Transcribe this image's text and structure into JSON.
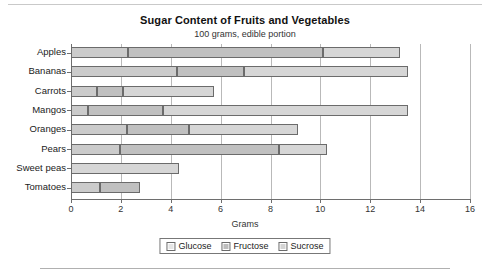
{
  "chart_data": {
    "type": "bar",
    "orientation": "horizontal",
    "stacked": true,
    "title": "Sugar Content of Fruits and Vegetables",
    "subtitle": "100 grams, edible portion",
    "xlabel": "Grams",
    "ylabel": "",
    "xlim": [
      0,
      16
    ],
    "xticks": [
      0,
      2,
      4,
      6,
      8,
      10,
      12,
      14,
      16
    ],
    "xtick_labels": [
      "0",
      "2",
      "4",
      "6",
      "8",
      "10",
      "12",
      "14",
      "16"
    ],
    "grid": "vertical",
    "legend_position": "bottom-center",
    "categories": [
      "Apples",
      "Bananas",
      "Carrots",
      "Mangos",
      "Oranges",
      "Pears",
      "Sweet peas",
      "Tomatoes"
    ],
    "series": [
      {
        "name": "Glucose",
        "color": "#cbcbcb",
        "values": [
          2.3,
          4.25,
          1.05,
          0.7,
          2.25,
          1.95,
          0.0,
          1.15
        ]
      },
      {
        "name": "Fructose",
        "color": "#c0c0c0",
        "values": [
          7.8,
          2.7,
          1.05,
          3.0,
          2.5,
          6.4,
          0.0,
          1.6
        ]
      },
      {
        "name": "Sucrose",
        "color": "#d6d6d6",
        "values": [
          3.1,
          6.55,
          3.65,
          9.8,
          4.35,
          1.9,
          4.35,
          0.0
        ]
      }
    ],
    "totals": [
      13.2,
      13.5,
      5.75,
      13.5,
      9.1,
      10.25,
      4.35,
      2.75
    ]
  },
  "legend": {
    "items": [
      {
        "label": "Glucose",
        "icon": "square-swatch"
      },
      {
        "label": "Fructose",
        "icon": "square-swatch"
      },
      {
        "label": "Sucrose",
        "icon": "square-swatch"
      }
    ]
  }
}
